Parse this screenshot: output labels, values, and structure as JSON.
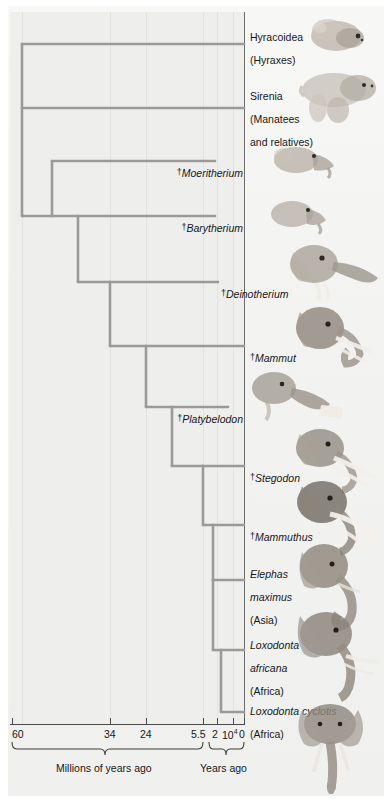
{
  "figure": {
    "type": "phylogenetic-tree"
  },
  "taxa": [
    {
      "id": "hyracoidea",
      "line1": "Hyracoidea",
      "line2": "(Hyraxes)",
      "extinct": false,
      "italic": false,
      "align": "left",
      "x": 250,
      "y": 26,
      "tip_y": 44,
      "art": "hyrax-illustration"
    },
    {
      "id": "sirenia",
      "line1": "Sirenia",
      "line2": "(Manatees",
      "line3": "and relatives)",
      "extinct": false,
      "italic": false,
      "align": "left",
      "x": 250,
      "y": 84,
      "tip_y": 108,
      "art": "manatee-illustration"
    },
    {
      "id": "moeritherium",
      "line1": "Moeritherium",
      "extinct": true,
      "italic": true,
      "align": "right",
      "x": 243,
      "y": 155,
      "tip_y": 161,
      "art": "moeritherium-illustration"
    },
    {
      "id": "barytherium",
      "line1": "Barytherium",
      "extinct": true,
      "italic": true,
      "align": "right",
      "x": 243,
      "y": 210,
      "tip_y": 216,
      "art": "barytherium-illustration"
    },
    {
      "id": "deinotherium",
      "line1": "Deinotherium",
      "extinct": true,
      "italic": true,
      "align": "left",
      "x": 221,
      "y": 276,
      "tip_y": 282,
      "art": "deinotherium-illustration"
    },
    {
      "id": "mammut",
      "line1": "Mammut",
      "extinct": true,
      "italic": true,
      "align": "left",
      "x": 250,
      "y": 340,
      "tip_y": 346,
      "art": "mammut-illustration"
    },
    {
      "id": "platybelodon",
      "line1": "Platybelodon",
      "extinct": true,
      "italic": true,
      "align": "right",
      "x": 243,
      "y": 401,
      "tip_y": 407,
      "art": "platybelodon-illustration"
    },
    {
      "id": "stegodon",
      "line1": "Stegodon",
      "extinct": true,
      "italic": true,
      "align": "left",
      "x": 250,
      "y": 460,
      "tip_y": 466,
      "art": "stegodon-illustration"
    },
    {
      "id": "mammuthus",
      "line1": "Mammuthus",
      "extinct": true,
      "italic": true,
      "align": "left",
      "x": 250,
      "y": 519,
      "tip_y": 525,
      "art": "mammuthus-illustration"
    },
    {
      "id": "elephas",
      "line1": "Elephas",
      "line2": "maximus",
      "line3": "(Asia)",
      "extinct": false,
      "italic": true,
      "align": "left",
      "x": 250,
      "y": 565,
      "tip_y": 580,
      "art": "asian-elephant-illustration"
    },
    {
      "id": "loxodonta-africana",
      "line1": "Loxodonta",
      "line2": "africana",
      "line3": "(Africa)",
      "extinct": false,
      "italic": true,
      "align": "left",
      "x": 250,
      "y": 636,
      "tip_y": 650,
      "art": "african-bush-elephant-illustration"
    },
    {
      "id": "loxodonta-cyclotis",
      "line1": "Loxodonta cyclotis",
      "line2": "(Africa)",
      "extinct": false,
      "italic": true,
      "align": "left",
      "x": 250,
      "y": 700,
      "tip_y": 712,
      "art": "african-forest-elephant-illustration"
    }
  ],
  "dagger_symbol": "†",
  "axis": {
    "line_y": 724,
    "ticks": [
      {
        "label": "60",
        "x": 12,
        "label_x": 12,
        "superscript": null
      },
      {
        "label": "34",
        "x": 110,
        "label_x": 104,
        "superscript": null
      },
      {
        "label": "24",
        "x": 146,
        "label_x": 140,
        "superscript": null
      },
      {
        "label": "5.5",
        "x": 203,
        "label_x": 193,
        "superscript": null
      },
      {
        "label": "2",
        "x": 217,
        "label_x": 213,
        "superscript": null
      },
      {
        "label": "10",
        "x": 233,
        "label_x": 224,
        "superscript": "4"
      },
      {
        "label": "0",
        "x": 244,
        "label_x": 240,
        "superscript": null
      }
    ],
    "brace_left": {
      "label": "Millions of years ago",
      "from": 12,
      "to": 203,
      "label_x": 58,
      "label_y": 760
    },
    "brace_right": {
      "label": "Years ago",
      "from": 209,
      "to": 244,
      "label_x": 203,
      "label_y": 760
    }
  },
  "gridlines_x": [
    22,
    110,
    146,
    203,
    217,
    233
  ],
  "colors": {
    "branch": "#9a9a9a",
    "axis": "#4a4a4a",
    "text": "#17171a",
    "plot_background": "#eeeeec",
    "gridline": "#e2e2df",
    "page_background": "#f4f4f2"
  },
  "tree": {
    "root_x": 22,
    "nodes": [
      {
        "id": "root",
        "x": 22,
        "y_top": 44,
        "y_bottom": 216
      },
      {
        "id": "proboscidea",
        "x": 52,
        "y_top": 161,
        "y_bottom": 282
      },
      {
        "id": "node-c",
        "x": 78,
        "y_top": 216,
        "y_bottom": 346
      },
      {
        "id": "node-d",
        "x": 110,
        "y_top": 282,
        "y_bottom": 407
      },
      {
        "id": "node-e",
        "x": 146,
        "y_top": 346,
        "y_bottom": 466
      },
      {
        "id": "node-f",
        "x": 172,
        "y_top": 407,
        "y_bottom": 525
      },
      {
        "id": "node-g",
        "x": 203,
        "y_top": 466,
        "y_bottom": 580
      },
      {
        "id": "node-h",
        "x": 213,
        "y_top": 525,
        "y_bottom": 650
      },
      {
        "id": "node-i",
        "x": 221,
        "y_top": 650,
        "y_bottom": 712
      }
    ]
  }
}
